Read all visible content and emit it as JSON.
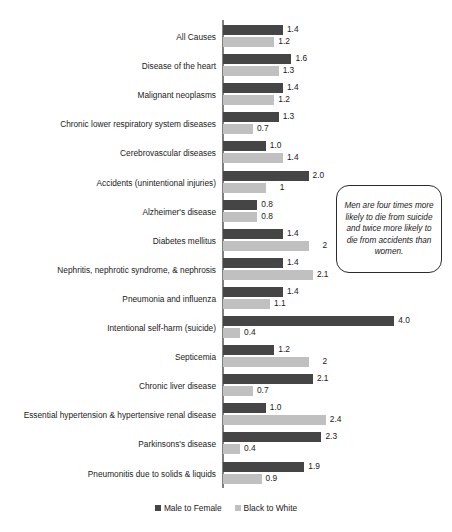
{
  "chart_data": {
    "type": "bar",
    "title": "",
    "subtitle": "",
    "xlabel": "",
    "ylabel": "",
    "orientation": "horizontal",
    "grid": false,
    "legend_position": "bottom",
    "xlim": [
      0,
      4.3
    ],
    "categories": [
      "All Causes",
      "Disease of the heart",
      "Malignant neoplasms",
      "Chronic lower respiratory system diseases",
      "Cerebrovascular diseases",
      "Accidents (unintentional injuries)",
      "Alzheimer's disease",
      "Diabetes mellitus",
      "Nephritis, nephrotic syndrome, & nephrosis",
      "Pneumonia and influenza",
      "Intentional self-harm (suicide)",
      "Septicemia",
      "Chronic liver disease",
      "Essential hypertension & hypertensive renal disease",
      "Parkinsons's disease",
      "Pneumonitis due to solids & liquids"
    ],
    "series": [
      {
        "name": "Male to Female",
        "color": "#454545",
        "values": [
          1.4,
          1.6,
          1.4,
          1.3,
          1.0,
          2.0,
          0.8,
          1.4,
          1.4,
          1.4,
          4.0,
          1.2,
          2.1,
          1.0,
          2.3,
          1.9
        ],
        "labels": [
          "1.4",
          "1.6",
          "1.4",
          "1.3",
          "1.0",
          "2.0",
          "0.8",
          "1.4",
          "1.4",
          "1.4",
          "4.0",
          "1.2",
          "2.1",
          "1.0",
          "2.3",
          "1.9"
        ]
      },
      {
        "name": "Black to White",
        "color": "#c0c0c0",
        "values": [
          1.2,
          1.3,
          1.2,
          0.7,
          1.4,
          1.0,
          0.8,
          2.0,
          2.1,
          1.1,
          0.4,
          2.0,
          0.7,
          2.4,
          0.4,
          0.9
        ],
        "labels": [
          "1.2",
          "1.3",
          "1.2",
          "0.7",
          "1.4",
          "1",
          "0.8",
          "2",
          "2.1",
          "1.1",
          "0.4",
          "2",
          "0.7",
          "2.4",
          "0.4",
          "0.9"
        ]
      }
    ],
    "annotations": [
      {
        "name": "callout",
        "text": "Men are four times more likely to die from suicide and twice more likely to die from accidents than women."
      }
    ]
  },
  "legend": {
    "items": [
      {
        "label": "Male to Female",
        "swatch": "male"
      },
      {
        "label": "Black to White",
        "swatch": "black"
      }
    ]
  }
}
